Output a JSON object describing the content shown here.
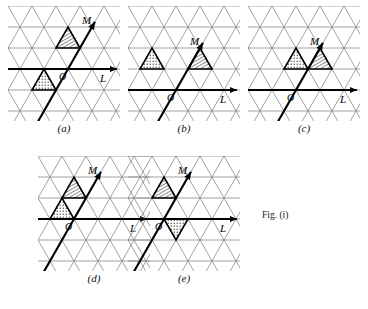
{
  "figure": {
    "caption": "Fig. (i)",
    "caption_pos": {
      "x": 262,
      "y": 210
    },
    "lattice": {
      "grid_color": "#8a8a8a",
      "axis_color": "#000000",
      "hatch_color": "#1a1a1a",
      "dot_color": "#1a1a1a",
      "cell_width": 24,
      "cell_height": 21,
      "rows": 6,
      "cols": 5
    },
    "axis_labels": {
      "horizontal": "L",
      "diagonal": "M",
      "origin": "O"
    },
    "panels": [
      {
        "id": "a",
        "label": "(a)",
        "x": 8,
        "y": 6,
        "w": 112,
        "h": 115,
        "label_y": 122,
        "origin": {
          "col": 2,
          "row": 3
        },
        "hatched_cells": [
          {
            "col": 2,
            "row": 2,
            "dir": "up"
          }
        ],
        "dotted_cells": [
          {
            "col": 1,
            "row": 4,
            "dir": "up"
          }
        ]
      },
      {
        "id": "b",
        "label": "(b)",
        "x": 128,
        "y": 6,
        "w": 112,
        "h": 115,
        "label_y": 122,
        "origin": {
          "col": 2,
          "row": 4
        },
        "hatched_cells": [
          {
            "col": 2,
            "row": 3,
            "dir": "up"
          }
        ],
        "dotted_cells": [
          {
            "col": 0,
            "row": 3,
            "dir": "up"
          }
        ]
      },
      {
        "id": "c",
        "label": "(c)",
        "x": 248,
        "y": 6,
        "w": 112,
        "h": 115,
        "label_y": 122,
        "origin": {
          "col": 2,
          "row": 4
        },
        "hatched_cells": [
          {
            "col": 2,
            "row": 3,
            "dir": "up"
          }
        ],
        "dotted_cells": [
          {
            "col": 1,
            "row": 3,
            "dir": "up"
          }
        ]
      },
      {
        "id": "d",
        "label": "(d)",
        "x": 38,
        "y": 156,
        "w": 112,
        "h": 115,
        "label_y": 272,
        "origin": {
          "col": 1,
          "row": 3
        },
        "hatched_cells": [
          {
            "col": 1,
            "row": 2,
            "dir": "up"
          }
        ],
        "dotted_cells": [
          {
            "col": 0,
            "row": 3,
            "dir": "up"
          }
        ]
      },
      {
        "id": "e",
        "label": "(e)",
        "x": 128,
        "y": 156,
        "w": 112,
        "h": 115,
        "label_y": 272,
        "origin": {
          "col": 1,
          "row": 3
        },
        "hatched_cells": [
          {
            "col": 1,
            "row": 2,
            "dir": "up"
          }
        ],
        "dotted_cells": [
          {
            "col": 1,
            "row": 3,
            "dir": "down"
          }
        ]
      }
    ]
  }
}
